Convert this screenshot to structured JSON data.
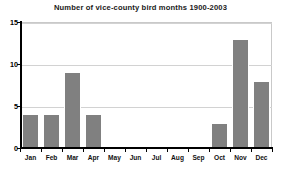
{
  "chart_data": {
    "type": "bar",
    "title": "Number of vice-county bird months 1900-2003",
    "xlabel": "",
    "ylabel": "",
    "categories": [
      "Jan",
      "Feb",
      "Mar",
      "Apr",
      "May",
      "Jun",
      "Jul",
      "Aug",
      "Sep",
      "Oct",
      "Nov",
      "Dec"
    ],
    "values": [
      4,
      4,
      9,
      4,
      0,
      0,
      0,
      0,
      0,
      3,
      13,
      8
    ],
    "ylim": [
      0,
      15
    ],
    "yticks": [
      0,
      5,
      10,
      15
    ],
    "ytick_labels": [
      "0",
      "5",
      "10",
      "15"
    ],
    "grid": true,
    "legend": false,
    "bar_color": "#808080",
    "bar_edge_color": "#ffffff",
    "gridline_color": "#d2d2d2",
    "axis_color": "#000000",
    "background_color": "#ffffff"
  }
}
